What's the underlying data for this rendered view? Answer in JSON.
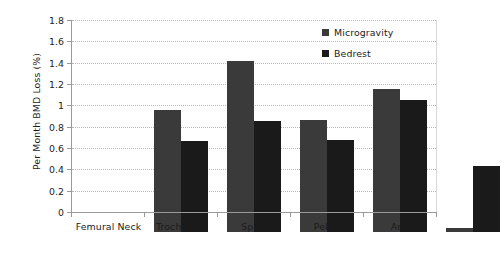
{
  "chart_data": {
    "type": "bar",
    "title": "",
    "xlabel": "",
    "ylabel": "Per Month BMD Loss (%)",
    "categories": [
      "Femural Neck",
      "Trochanter",
      "Spine",
      "Pelvis",
      "Arm"
    ],
    "series": [
      {
        "name": "Microgravity",
        "color": "#3a3a3a",
        "values": [
          1.14,
          1.6,
          1.05,
          1.34,
          0.04
        ]
      },
      {
        "name": "Bedrest",
        "color": "#1a1a1a",
        "values": [
          0.85,
          1.04,
          0.86,
          1.24,
          0.62
        ]
      }
    ],
    "ylim": [
      0,
      1.8
    ],
    "ytick_labels": [
      "0",
      "0.2",
      "0.4",
      "0.6",
      "0.8",
      "1",
      "1.2",
      "1.4",
      "1.6",
      "1.8"
    ],
    "ytick_values": [
      0,
      0.2,
      0.4,
      0.6,
      0.8,
      1.0,
      1.2,
      1.4,
      1.6,
      1.8
    ],
    "grid": "horizontal-dotted",
    "grid_color": "#b8b8b8",
    "axis_color": "#9a9a9a",
    "legend_position": "top-right",
    "background": "#ffffff"
  }
}
